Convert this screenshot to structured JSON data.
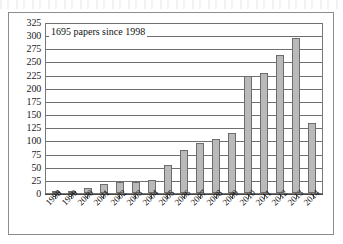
{
  "chart_data": {
    "type": "bar",
    "title": "",
    "annotation": "1695 papers since 1998",
    "xlabel": "",
    "ylabel": "",
    "ylim": [
      0,
      325
    ],
    "ytick_step": 25,
    "grid": true,
    "legend": "none",
    "bar_color": "#b9b9b9",
    "bar_border_color": "#6d6d6d",
    "categories": [
      "1998",
      "1999",
      "2000",
      "2001",
      "2002",
      "2003",
      "2004",
      "2005",
      "2006",
      "2007",
      "2008",
      "2009",
      "2010",
      "2011",
      "2012",
      "2013",
      "2014"
    ],
    "values": [
      3,
      4,
      9,
      17,
      21,
      21,
      25,
      53,
      81,
      96,
      102,
      115,
      223,
      229,
      262,
      295,
      134
    ],
    "yticks": [
      0,
      25,
      50,
      75,
      100,
      125,
      150,
      175,
      200,
      225,
      250,
      275,
      300,
      325
    ],
    "ytick_labels": [
      "0",
      "25",
      "50",
      "75",
      "100",
      "125",
      "150",
      "175",
      "200",
      "225",
      "250",
      "275",
      "300",
      "325"
    ]
  }
}
